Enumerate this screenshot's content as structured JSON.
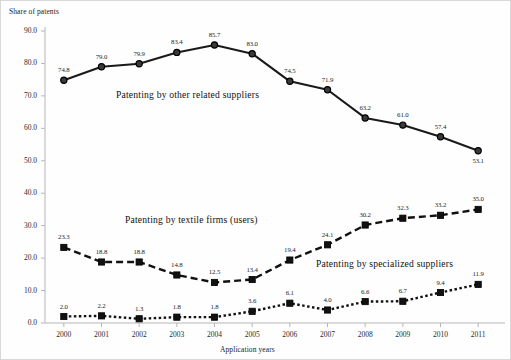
{
  "chart_data": {
    "type": "line",
    "title": "",
    "xlabel": "Application years",
    "ylabel": "Share of patents",
    "categories": [
      "2000",
      "2001",
      "2002",
      "2003",
      "2004",
      "2005",
      "2006",
      "2007",
      "2008",
      "2009",
      "2010",
      "2011"
    ],
    "x": [
      2000,
      2001,
      2002,
      2003,
      2004,
      2005,
      2006,
      2007,
      2008,
      2009,
      2010,
      2011
    ],
    "ylim": [
      0.0,
      90.0
    ],
    "yticks": [
      "0.0",
      "10.0",
      "20.0",
      "30.0",
      "40.0",
      "50.0",
      "60.0",
      "70.0",
      "80.0",
      "90.0"
    ],
    "ytick_values": [
      0.0,
      10.0,
      20.0,
      30.0,
      40.0,
      50.0,
      60.0,
      70.0,
      80.0,
      90.0
    ],
    "grid": false,
    "legend_position": "inline-annotations",
    "series": [
      {
        "name": "Patenting by other related suppliers",
        "marker": "circle",
        "line_style": "solid",
        "color": "#1a1a1a",
        "values": [
          74.8,
          79.0,
          79.9,
          83.4,
          85.7,
          83.0,
          74.5,
          71.9,
          63.2,
          61.0,
          57.4,
          53.1
        ],
        "labels": [
          "74.8",
          "79.0",
          "79.9",
          "83.4",
          "85.7",
          "83.0",
          "74.5",
          "71.9",
          "63.2",
          "61.0",
          "57.4",
          "53.1"
        ]
      },
      {
        "name": "Patenting by textile firms (users)",
        "marker": "square",
        "line_style": "dashed",
        "color": "#111111",
        "values": [
          23.3,
          18.8,
          18.8,
          14.8,
          12.5,
          13.4,
          19.4,
          24.1,
          30.2,
          32.3,
          33.2,
          35.0
        ],
        "labels": [
          "23.3",
          "18.8",
          "18.8",
          "14.8",
          "12.5",
          "13.4",
          "19.4",
          "24.1",
          "30.2",
          "32.3",
          "33.2",
          "35.0"
        ]
      },
      {
        "name": "Patenting by specialized suppliers",
        "marker": "square",
        "line_style": "dotted",
        "color": "#111111",
        "values": [
          2.0,
          2.2,
          1.3,
          1.8,
          1.8,
          3.6,
          6.1,
          4.0,
          6.6,
          6.7,
          9.4,
          11.9
        ],
        "labels": [
          "2.0",
          "2.2",
          "1.3",
          "1.8",
          "1.8",
          "3.6",
          "6.1",
          "4.0",
          "6.6",
          "6.7",
          "9.4",
          "11.9"
        ]
      }
    ],
    "annotations": [
      {
        "text": "Patenting by other related suppliers",
        "x": 115,
        "y": 88
      },
      {
        "text": "Patenting by textile firms (users)",
        "x": 124,
        "y": 213
      },
      {
        "text": "Patenting by specialized suppliers",
        "x": 315,
        "y": 257
      }
    ]
  }
}
